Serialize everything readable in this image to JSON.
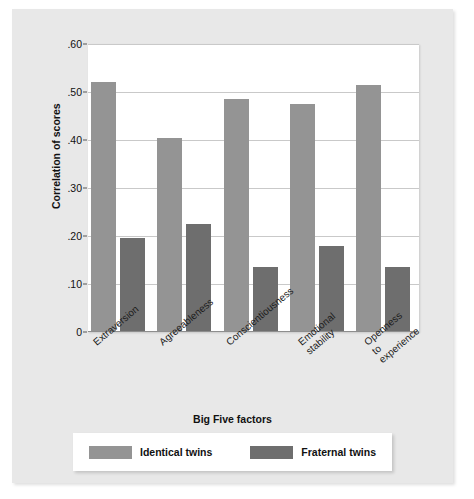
{
  "chart_data": {
    "type": "bar",
    "title": "",
    "subtitle": "",
    "xlabel": "Big Five factors",
    "ylabel": "Correlation of scores",
    "categories": [
      "Extraversion",
      "Agreeableness",
      "Conscientiousness",
      "Emotional stability",
      "Openness to experience"
    ],
    "category_lines": [
      [
        "Extraversion"
      ],
      [
        "Agreeableness"
      ],
      [
        "Conscientiousness"
      ],
      [
        "Emotional",
        "stability"
      ],
      [
        "Openness",
        "to",
        "experience"
      ]
    ],
    "series": [
      {
        "name": "Identical twins",
        "color": "#949494",
        "values": [
          0.52,
          0.405,
          0.485,
          0.475,
          0.515
        ]
      },
      {
        "name": "Fraternal twins",
        "color": "#6e6e6e",
        "values": [
          0.195,
          0.225,
          0.135,
          0.18,
          0.135
        ]
      }
    ],
    "ylim": [
      0,
      0.6
    ],
    "yticks": [
      0.6,
      0.5,
      0.4,
      0.3,
      0.2,
      0.1,
      0
    ],
    "ytick_labels": [
      ".60",
      ".50",
      ".40",
      ".30",
      ".20",
      ".10",
      "0"
    ],
    "grid": true,
    "legend_position": "bottom"
  },
  "colors": {
    "page_background": "#ffffff",
    "panel_background": "#e8e8e8",
    "plot_background": "#ffffff",
    "gridline": "#c9c9c9",
    "identical_twins": "#949494",
    "fraternal_twins": "#6e6e6e",
    "text": "#111111"
  },
  "legend": {
    "entries": [
      {
        "label": "Identical twins",
        "color": "#949494"
      },
      {
        "label": "Fraternal twins",
        "color": "#6e6e6e"
      }
    ]
  }
}
